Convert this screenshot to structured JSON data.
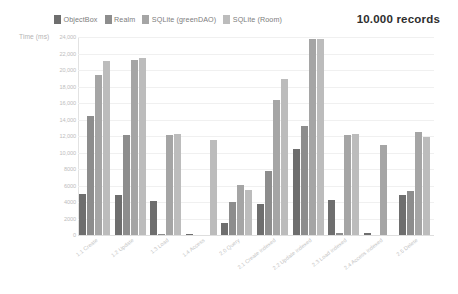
{
  "chart_title": "10.000 records",
  "y_axis_title": "Time (ms)",
  "legend": {
    "position": "top-left",
    "items": [
      {
        "label": "ObjectBox",
        "color": "#6e6e6e"
      },
      {
        "label": "Realm",
        "color": "#8d8d8d"
      },
      {
        "label": "SQLite (greenDAO)",
        "color": "#a5a5a5"
      },
      {
        "label": "SQLite (Room)",
        "color": "#bcbcbc"
      }
    ]
  },
  "y_ticks": [
    "24,000",
    "22,000",
    "20,000",
    "18,000",
    "16,000",
    "14,000",
    "12,000",
    "10,000",
    "8000",
    "6000",
    "4000",
    "2000",
    "0"
  ],
  "chart_data": {
    "type": "bar",
    "title": "10.000 records",
    "xlabel": "",
    "ylabel": "Time (ms)",
    "ylim": [
      0,
      24000
    ],
    "ytick_values": [
      0,
      2000,
      4000,
      6000,
      8000,
      10000,
      12000,
      14000,
      16000,
      18000,
      20000,
      22000,
      24000
    ],
    "grid": true,
    "legend_position": "top-left",
    "categories": [
      "1.1 Create",
      "1.2 Update",
      "1.3 Load",
      "1.4 Access",
      "2.0 Query",
      "2.1 Create indexed",
      "2.2 Update indexed",
      "2.3 Load indexed",
      "2.4 Access indexed",
      "2.5 Delete"
    ],
    "series": [
      {
        "name": "ObjectBox",
        "color": "#6e6e6e",
        "values": [
          5000,
          4900,
          4100,
          100,
          1500,
          3700,
          10400,
          4300,
          200,
          4800
        ]
      },
      {
        "name": "Realm",
        "color": "#8d8d8d",
        "values": [
          14400,
          12100,
          100,
          0,
          4000,
          7800,
          13200,
          300,
          0,
          5300
        ]
      },
      {
        "name": "SQLite (greenDAO)",
        "color": "#a5a5a5",
        "values": [
          19400,
          21200,
          12100,
          0,
          6100,
          16400,
          23800,
          12100,
          10900,
          12500
        ]
      },
      {
        "name": "SQLite (Room)",
        "color": "#bcbcbc",
        "values": [
          21100,
          21500,
          12200,
          11500,
          5500,
          18900,
          23800,
          12200,
          0,
          11900
        ]
      }
    ]
  }
}
